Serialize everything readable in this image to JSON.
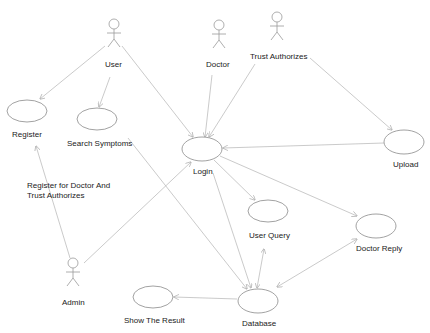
{
  "diagram": {
    "type": "UML use case diagram",
    "colors": {
      "line": "#b8b8b8",
      "ellipse": "#8a8a8a",
      "actor": "#9a9a9a",
      "text": "#222222",
      "background": "#ffffff"
    },
    "actors": [
      {
        "id": "user",
        "label": "User",
        "x": 114,
        "y": 24
      },
      {
        "id": "doctor",
        "label": "Doctor",
        "x": 219,
        "y": 25
      },
      {
        "id": "trust",
        "label": "Trust Authorizes",
        "x": 277,
        "y": 17
      },
      {
        "id": "admin",
        "label": "Admin",
        "x": 73,
        "y": 263
      }
    ],
    "use_cases": [
      {
        "id": "register",
        "label": "Register",
        "cx": 27,
        "cy": 111,
        "rx": 20,
        "ry": 11
      },
      {
        "id": "search",
        "label": "Search Symptoms",
        "cx": 97,
        "cy": 119,
        "rx": 20,
        "ry": 11
      },
      {
        "id": "login",
        "label": "Login",
        "cx": 202,
        "cy": 149,
        "rx": 20,
        "ry": 12
      },
      {
        "id": "upload",
        "label": "Upload",
        "cx": 404,
        "cy": 142,
        "rx": 20,
        "ry": 12
      },
      {
        "id": "userquery",
        "label": "User Query",
        "cx": 268,
        "cy": 211,
        "rx": 20,
        "ry": 11
      },
      {
        "id": "doctorreply",
        "label": "Doctor Reply",
        "cx": 376,
        "cy": 226,
        "rx": 20,
        "ry": 12
      },
      {
        "id": "showresult",
        "label": "Show The Result",
        "cx": 153,
        "cy": 297,
        "rx": 20,
        "ry": 11
      },
      {
        "id": "database",
        "label": "Database",
        "cx": 258,
        "cy": 301,
        "rx": 20,
        "ry": 12
      }
    ],
    "relationships": [
      {
        "from": "user",
        "to": "register"
      },
      {
        "from": "user",
        "to": "search"
      },
      {
        "from": "user",
        "to": "login"
      },
      {
        "from": "doctor",
        "to": "login"
      },
      {
        "from": "trust",
        "to": "login"
      },
      {
        "from": "trust",
        "to": "upload"
      },
      {
        "from": "upload",
        "to": "login"
      },
      {
        "from": "admin",
        "to": "register",
        "label": "Register for Doctor And Trust Authorizes"
      },
      {
        "from": "admin",
        "to": "login"
      },
      {
        "from": "login",
        "to": "userquery"
      },
      {
        "from": "login",
        "to": "doctorreply"
      },
      {
        "from": "login",
        "to": "database"
      },
      {
        "from": "search",
        "to": "database"
      },
      {
        "from": "userquery",
        "to": "database",
        "bidirectional": true
      },
      {
        "from": "doctorreply",
        "to": "database",
        "bidirectional": true
      },
      {
        "from": "database",
        "to": "showresult"
      }
    ],
    "annotation": "Register for Doctor And Trust Authorizes"
  }
}
